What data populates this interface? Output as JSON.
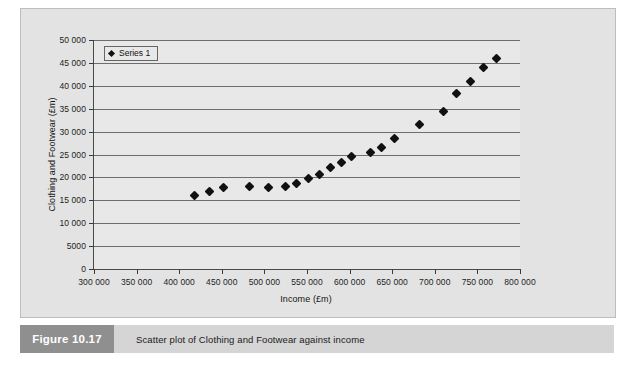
{
  "figure": {
    "number_label": "Figure 10.17",
    "caption": "Scatter plot of Clothing and Footwear against income"
  },
  "legend": {
    "position": "top-left-inside",
    "marker_name": "diamond-marker",
    "entries": [
      "Series 1"
    ]
  },
  "colors": {
    "panel_background": "#e3e3e3",
    "plot_background": "#e8e8e8",
    "gridline": "#6e6e6e",
    "axis_line": "#4a4a4a",
    "marker": "#111111",
    "caption_bar": "#d5d5d5",
    "caption_number_box": "#8f8f8f"
  },
  "chart_data": {
    "type": "scatter",
    "title": "",
    "xlabel": "Income (£m)",
    "ylabel": "Clothing and Footwear (£m)",
    "xlim": [
      300000,
      800000
    ],
    "ylim": [
      0,
      50000
    ],
    "grid": true,
    "xticks": [
      300000,
      350000,
      400000,
      450000,
      500000,
      550000,
      600000,
      650000,
      700000,
      750000,
      800000
    ],
    "xtick_labels": [
      "300 000",
      "350 000",
      "400 000",
      "450 000",
      "500 000",
      "550 000",
      "600 000",
      "650 000",
      "700 000",
      "750 000",
      "800 000"
    ],
    "yticks": [
      0,
      5000,
      10000,
      15000,
      20000,
      25000,
      30000,
      35000,
      40000,
      45000,
      50000
    ],
    "ytick_labels": [
      "0",
      "5000",
      "10 000",
      "15 000",
      "20 000",
      "25 000",
      "30 000",
      "35 000",
      "40 000",
      "45 000",
      "50 000"
    ],
    "series": [
      {
        "name": "Series 1",
        "marker": "diamond",
        "color": "#111111",
        "points": [
          [
            418000,
            16000
          ],
          [
            435000,
            17000
          ],
          [
            452000,
            17700
          ],
          [
            483000,
            18100
          ],
          [
            505000,
            17900
          ],
          [
            525000,
            18100
          ],
          [
            538000,
            18600
          ],
          [
            552000,
            19700
          ],
          [
            565000,
            20600
          ],
          [
            578000,
            22100
          ],
          [
            590000,
            23200
          ],
          [
            602000,
            24600
          ],
          [
            625000,
            25500
          ],
          [
            637000,
            26600
          ],
          [
            653000,
            28600
          ],
          [
            682000,
            31600
          ],
          [
            710000,
            34300
          ],
          [
            725000,
            38400
          ],
          [
            742000,
            41000
          ],
          [
            757000,
            44000
          ],
          [
            772000,
            46000
          ]
        ]
      }
    ]
  }
}
